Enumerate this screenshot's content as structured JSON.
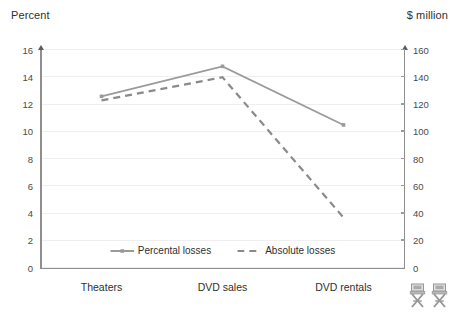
{
  "chart_data": {
    "type": "line",
    "title": "",
    "subtitle": "",
    "xlabel": "",
    "ylabel": "Percent",
    "y2label": "$ million",
    "categories": [
      "Theaters",
      "DVD sales",
      "DVD rentals"
    ],
    "series": [
      {
        "name": "Percental losses",
        "axis": "left",
        "style": "solid",
        "color": "#9a9a9a",
        "marker": "square",
        "values": [
          12.6,
          14.8,
          10.5
        ]
      },
      {
        "name": "Absolute losses",
        "axis": "right",
        "style": "dashed",
        "color": "#8a8a8a",
        "marker": "none",
        "values": [
          123,
          140,
          37
        ]
      }
    ],
    "ylim": [
      0,
      16
    ],
    "yticks": [
      0,
      2,
      4,
      6,
      8,
      10,
      12,
      14,
      16
    ],
    "y2lim": [
      0,
      160
    ],
    "y2ticks": [
      0,
      20,
      40,
      60,
      80,
      100,
      120,
      140,
      160
    ],
    "grid": true,
    "grid_axis": "y",
    "legend_position": "bottom-center-inside",
    "background": "#ffffff",
    "gridline_color": "#efeff1",
    "axis_color": "#8e8e8e",
    "text_color": "#2f2f2f"
  },
  "axes": {
    "left_title": "Percent",
    "right_title": "$ million"
  },
  "legend": {
    "items": [
      {
        "label": "Percental losses"
      },
      {
        "label": "Absolute losses"
      }
    ]
  },
  "decorations": {
    "icons": [
      "director-chair-icon",
      "director-chair-icon"
    ]
  }
}
